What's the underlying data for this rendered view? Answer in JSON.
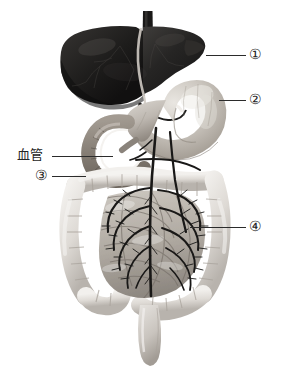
{
  "figure": {
    "background_color": "#ffffff",
    "leader_line_color": "#2b2b2b",
    "organs": [
      {
        "id": "liver",
        "name": "liver",
        "callout": "1",
        "tone": "#2a2a2a"
      },
      {
        "id": "stomach",
        "name": "stomach",
        "callout": "2",
        "tone": "#b9b4ad"
      },
      {
        "id": "large-intestine",
        "name": "large-intestine",
        "callout": "3",
        "tone": "#dcd8d2"
      },
      {
        "id": "small-intestine",
        "name": "small-intestine",
        "callout": "4",
        "tone": "#b4afa8"
      },
      {
        "id": "duodenum",
        "name": "duodenum",
        "tone": "#9a948c"
      },
      {
        "id": "rectum",
        "name": "rectum",
        "tone": "#cdc8c2"
      },
      {
        "id": "blood-vessel",
        "name": "blood-vessel",
        "tone": "#1e1e1e"
      }
    ]
  },
  "labels": {
    "callout_1": "①",
    "callout_2": "②",
    "callout_3": "③",
    "callout_4": "④",
    "blood_vessel": "血管"
  },
  "leader_lines": [
    {
      "name": "leader-line-1",
      "x1": 206,
      "y1": 55,
      "x2": 246,
      "y2": 55
    },
    {
      "name": "leader-line-2",
      "x1": 219,
      "y1": 100,
      "x2": 246,
      "y2": 100
    },
    {
      "name": "leader-line-3",
      "x1": 52,
      "y1": 176,
      "x2": 86,
      "y2": 176
    },
    {
      "name": "leader-line-4",
      "x1": 190,
      "y1": 227,
      "x2": 246,
      "y2": 227
    },
    {
      "name": "leader-line-blood-vessel",
      "x1": 52,
      "y1": 156,
      "x2": 113,
      "y2": 156
    }
  ]
}
